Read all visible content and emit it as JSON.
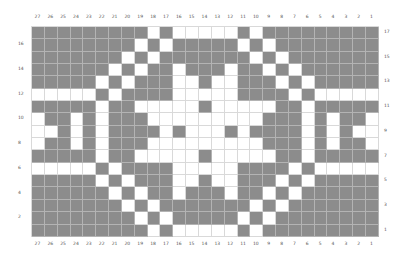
{
  "chart": {
    "columns": 27,
    "rows": 17,
    "column_labels": [
      "27",
      "26",
      "25",
      "24",
      "23",
      "22",
      "21",
      "20",
      "19",
      "18",
      "17",
      "16",
      "15",
      "14",
      "13",
      "12",
      "11",
      "10",
      "9",
      "8",
      "7",
      "6",
      "5",
      "4",
      "3",
      "2",
      "1"
    ],
    "row_labels_left": [
      "16",
      "14",
      "12",
      "10",
      "8",
      "6",
      "4",
      "2"
    ],
    "row_labels_right": [
      "17",
      "15",
      "13",
      "11",
      "9",
      "7",
      "5",
      "3",
      "1"
    ],
    "colors": {
      "filled": "#8c8c8c",
      "empty": "#ffffff",
      "gridline": "#d9d9d9"
    },
    "grid_rows_top_to_bottom": [
      "111111111010000010111111111",
      "111111110101111101011111111",
      "111111101011111110101111111",
      "111111010110111011010111111",
      "111110101110010011101011111",
      "000001011110000011110100000",
      "111110110000010000011011111",
      "011010111000000000111010110",
      "001010111101000101111010100",
      "011010111000000000111010110",
      "111110110000010000011011111",
      "000001011110000011110100000",
      "111110101110010011101011111",
      "111111010110111011010111111",
      "111111101011111110101111111",
      "111111110101111101011111111",
      "111111111010000010111111111"
    ]
  }
}
